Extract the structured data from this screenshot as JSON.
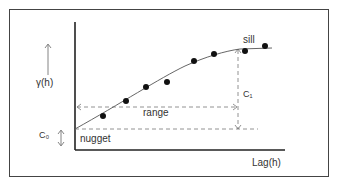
{
  "diagram": {
    "labels": {
      "y_axis": "γ(h)",
      "x_axis": "Lag(h)",
      "nugget": "nugget",
      "nugget_symbol": "C₀",
      "range": "range",
      "partial_sill_symbol": "C₁",
      "sill": "sill"
    },
    "colors": {
      "axis": "#222222",
      "curve": "#555555",
      "dashed": "#777777",
      "points": "#111111",
      "frame": "#444444"
    },
    "points": [
      {
        "x": 103,
        "y": 116
      },
      {
        "x": 126,
        "y": 101
      },
      {
        "x": 146,
        "y": 87
      },
      {
        "x": 167,
        "y": 82
      },
      {
        "x": 194,
        "y": 61
      },
      {
        "x": 214,
        "y": 54
      },
      {
        "x": 245,
        "y": 51
      },
      {
        "x": 265,
        "y": 46
      }
    ]
  }
}
